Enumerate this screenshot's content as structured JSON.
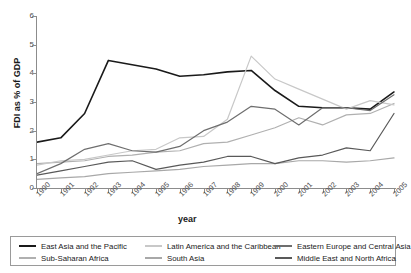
{
  "chart_data": {
    "type": "line",
    "title": "",
    "xlabel": "year",
    "ylabel": "FDI as % of GDP",
    "x": [
      1990,
      1991,
      1992,
      1993,
      1994,
      1995,
      1996,
      1997,
      1998,
      1999,
      2000,
      2001,
      2002,
      2003,
      2004,
      2005
    ],
    "xlim": [
      1990,
      2005
    ],
    "ylim": [
      0,
      6
    ],
    "yticks": [
      0,
      1,
      2,
      3,
      4,
      5,
      6
    ],
    "grid": false,
    "legend_position": "bottom",
    "series": [
      {
        "name": "East Asia and the Pacific",
        "color": "#1a1a1a",
        "values": [
          1.6,
          1.75,
          2.6,
          4.45,
          4.3,
          4.15,
          3.9,
          3.95,
          4.05,
          4.1,
          3.4,
          2.85,
          2.8,
          2.8,
          2.75,
          3.35
        ]
      },
      {
        "name": "Sub-Saharan Africa",
        "color": "#b0b0b0",
        "values": [
          0.85,
          0.9,
          0.95,
          1.1,
          1.15,
          1.25,
          1.3,
          1.55,
          1.6,
          1.85,
          2.1,
          2.45,
          2.2,
          2.55,
          2.6,
          2.95
        ]
      },
      {
        "name": "Latin America and the Caribbean",
        "color": "#c8c8c8",
        "values": [
          0.8,
          0.95,
          1.0,
          1.15,
          1.3,
          1.35,
          1.75,
          1.8,
          2.4,
          4.6,
          3.8,
          3.45,
          3.1,
          2.75,
          3.05,
          2.9
        ]
      },
      {
        "name": "South Asia",
        "color": "#a8a8a8",
        "values": [
          0.3,
          0.35,
          0.4,
          0.5,
          0.55,
          0.6,
          0.65,
          0.75,
          0.8,
          0.85,
          0.85,
          0.95,
          0.95,
          0.9,
          0.95,
          1.05
        ]
      },
      {
        "name": "Eastern Europe and Central Asia",
        "color": "#6e6e6e",
        "values": [
          0.5,
          0.85,
          1.35,
          1.55,
          1.3,
          1.25,
          1.45,
          2.0,
          2.3,
          2.85,
          2.75,
          2.2,
          2.8,
          2.8,
          2.7,
          3.25
        ]
      },
      {
        "name": "Middle East and North Africa",
        "color": "#595959",
        "values": [
          0.45,
          0.6,
          0.75,
          0.9,
          0.95,
          0.65,
          0.8,
          0.9,
          1.1,
          1.1,
          0.85,
          1.05,
          1.15,
          1.4,
          1.3,
          2.6
        ]
      }
    ]
  },
  "axes": {
    "y_title": "FDI as % of GDP",
    "x_title": "year",
    "y_ticks": [
      "0",
      "1",
      "2",
      "3",
      "4",
      "5",
      "6"
    ],
    "x_ticks": [
      "1990",
      "1991",
      "1992",
      "1993",
      "1994",
      "1995",
      "1996",
      "1997",
      "1998",
      "1999",
      "2000",
      "2001",
      "2002",
      "2003",
      "2004",
      "2005"
    ]
  },
  "legend": {
    "columns": [
      [
        {
          "label": "East Asia and the Pacific",
          "color": "#1a1a1a"
        },
        {
          "label": "Sub-Saharan Africa",
          "color": "#b0b0b0"
        }
      ],
      [
        {
          "label": "Latin America and the Caribbean",
          "color": "#c8c8c8"
        },
        {
          "label": "South Asia",
          "color": "#a8a8a8"
        }
      ],
      [
        {
          "label": "Eastern Europe and Central Asia",
          "color": "#6e6e6e"
        },
        {
          "label": "Middle East and North Africa",
          "color": "#595959"
        }
      ]
    ]
  }
}
